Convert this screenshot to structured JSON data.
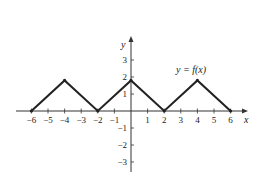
{
  "chart_data": {
    "type": "line",
    "title": "",
    "xlabel": "x",
    "ylabel": "y",
    "function_label": "y = f(x)",
    "x_ticks": [
      -6,
      -5,
      -4,
      -3,
      -2,
      -1,
      1,
      2,
      3,
      4,
      5,
      6
    ],
    "y_ticks": [
      -3,
      -2,
      -1,
      1,
      2,
      3
    ],
    "x_tick_labels": [
      "−6",
      "−5",
      "−4",
      "−3",
      "−2",
      "−1",
      "1",
      "2",
      "3",
      "4",
      "5",
      "6"
    ],
    "y_tick_labels": [
      "−3",
      "−2",
      "−1",
      "1",
      "2",
      "3"
    ],
    "xlim": [
      -7,
      7
    ],
    "ylim": [
      -3.5,
      4
    ],
    "grid": false,
    "legend": "none",
    "series": [
      {
        "name": "f(x)",
        "x": [
          -6,
          -4,
          -2,
          0,
          2,
          4,
          6
        ],
        "y": [
          0,
          1.8,
          0,
          1.8,
          0,
          1.8,
          0
        ]
      }
    ],
    "line_color": "#222222"
  }
}
